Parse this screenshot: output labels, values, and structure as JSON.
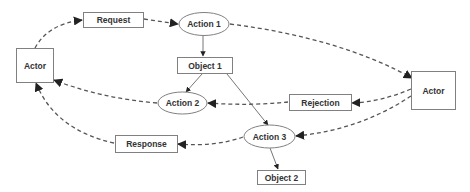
{
  "diagram": {
    "type": "flow",
    "nodes": [
      {
        "id": "actor_left",
        "label": "Actor",
        "shape": "rect"
      },
      {
        "id": "request",
        "label": "Request",
        "shape": "rect"
      },
      {
        "id": "action1",
        "label": "Action 1",
        "shape": "ellipse"
      },
      {
        "id": "object1",
        "label": "Object 1",
        "shape": "rect"
      },
      {
        "id": "action2",
        "label": "Action 2",
        "shape": "ellipse"
      },
      {
        "id": "rejection",
        "label": "Rejection",
        "shape": "rect"
      },
      {
        "id": "actor_right",
        "label": "Actor",
        "shape": "rect"
      },
      {
        "id": "action3",
        "label": "Action 3",
        "shape": "ellipse"
      },
      {
        "id": "response",
        "label": "Response",
        "shape": "rect"
      },
      {
        "id": "object2",
        "label": "Object 2",
        "shape": "rect"
      }
    ],
    "edges": [
      {
        "from": "actor_left",
        "to": "request",
        "style": "dashed"
      },
      {
        "from": "request",
        "to": "action1",
        "style": "dashed"
      },
      {
        "from": "action1",
        "to": "actor_right",
        "style": "dashed"
      },
      {
        "from": "action1",
        "to": "object1",
        "style": "solid"
      },
      {
        "from": "object1",
        "to": "action2",
        "style": "solid"
      },
      {
        "from": "object1",
        "to": "action3",
        "style": "solid"
      },
      {
        "from": "action2",
        "to": "actor_left",
        "style": "dashed"
      },
      {
        "from": "rejection",
        "to": "action2",
        "style": "dashed"
      },
      {
        "from": "actor_right",
        "to": "rejection",
        "style": "dashed"
      },
      {
        "from": "actor_right",
        "to": "action3",
        "style": "dashed"
      },
      {
        "from": "action3",
        "to": "response",
        "style": "dashed"
      },
      {
        "from": "response",
        "to": "actor_left",
        "style": "dashed"
      },
      {
        "from": "action3",
        "to": "object2",
        "style": "solid"
      }
    ]
  },
  "labels": {
    "actor_left": "Actor",
    "request": "Request",
    "action1": "Action 1",
    "object1": "Object 1",
    "action2": "Action 2",
    "rejection": "Rejection",
    "actor_right": "Actor",
    "action3": "Action 3",
    "response": "Response",
    "object2": "Object 2"
  },
  "colors": {
    "stroke": "#808080",
    "edge": "#555555",
    "text": "#333333",
    "background": "#ffffff"
  }
}
